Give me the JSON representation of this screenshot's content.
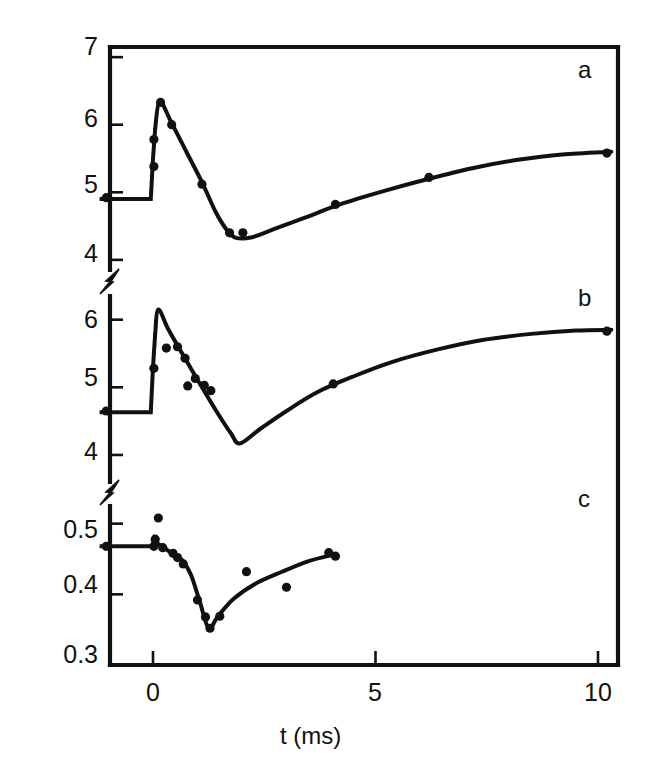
{
  "figure": {
    "background": "#ffffff",
    "ink_color": "#111111",
    "axis_label_x": "t (ms)",
    "axis_label_y_prefix": "H",
    "axis_label_y_sub": "2",
    "axis_label_y_suffix": " partial pressure (Pa)"
  },
  "axes": {
    "x": {
      "label": "t (ms)",
      "ticks": [
        "0",
        "5",
        "10"
      ],
      "tick_values": [
        0,
        5,
        10
      ],
      "range": [
        -1.2,
        10.6
      ],
      "px_left": 110,
      "px_right": 618,
      "px_x0": 153,
      "px_per_unit": 44.5
    },
    "panels": [
      {
        "id": "a",
        "label": "a",
        "ticks": [
          "7",
          "6",
          "5",
          "4"
        ],
        "tick_values": [
          7,
          6,
          5,
          4
        ],
        "px_top": 47,
        "px_bottom": 270,
        "y_at_px_top": 7.15,
        "y_at_px_bottom": 3.85
      },
      {
        "id": "b",
        "label": "b",
        "ticks": [
          "6",
          "5",
          "4"
        ],
        "tick_values": [
          6,
          5,
          4
        ],
        "px_top": 296,
        "px_bottom": 482,
        "y_at_px_top": 6.35,
        "y_at_px_bottom": 3.6
      },
      {
        "id": "c",
        "label": "c",
        "ticks": [
          "0.5",
          "0.4",
          "0.3"
        ],
        "tick_values": [
          0.5,
          0.4,
          0.3
        ],
        "px_top": 506,
        "px_bottom": 665,
        "y_at_px_top": 0.525,
        "y_at_px_bottom": 0.3
      }
    ],
    "breaks": [
      {
        "after_panel": "a",
        "px_y": 283
      },
      {
        "after_panel": "b",
        "px_y": 494
      }
    ]
  },
  "chart_data": {
    "type": "line",
    "title": "",
    "xlabel": "t (ms)",
    "ylabel": "H2 partial pressure (Pa)",
    "xlim": [
      -1.2,
      10.6
    ],
    "grid": false,
    "legend": "none",
    "panels": [
      {
        "id": "a",
        "label": "a",
        "ylim": [
          3.85,
          7.15
        ],
        "yticks": [
          4,
          5,
          6,
          7
        ],
        "baseline": 4.9,
        "peak": {
          "t": 0.15,
          "y": 6.35
        },
        "minimum": {
          "t": 1.85,
          "y": 4.33
        },
        "plateau": 5.6,
        "curve": [
          {
            "t": -1.2,
            "y": 4.9
          },
          {
            "t": -0.05,
            "y": 4.9
          },
          {
            "t": 0.0,
            "y": 5.5
          },
          {
            "t": 0.05,
            "y": 5.95
          },
          {
            "t": 0.15,
            "y": 6.35
          },
          {
            "t": 0.4,
            "y": 6.05
          },
          {
            "t": 0.75,
            "y": 5.6
          },
          {
            "t": 1.1,
            "y": 5.15
          },
          {
            "t": 1.4,
            "y": 4.72
          },
          {
            "t": 1.65,
            "y": 4.45
          },
          {
            "t": 1.85,
            "y": 4.33
          },
          {
            "t": 2.2,
            "y": 4.33
          },
          {
            "t": 2.7,
            "y": 4.45
          },
          {
            "t": 3.4,
            "y": 4.62
          },
          {
            "t": 4.2,
            "y": 4.82
          },
          {
            "t": 5.2,
            "y": 5.02
          },
          {
            "t": 6.2,
            "y": 5.2
          },
          {
            "t": 7.2,
            "y": 5.36
          },
          {
            "t": 8.2,
            "y": 5.48
          },
          {
            "t": 9.2,
            "y": 5.56
          },
          {
            "t": 10.3,
            "y": 5.6
          }
        ],
        "points": [
          {
            "t": -1.05,
            "y": 4.92
          },
          {
            "t": 0.02,
            "y": 5.78
          },
          {
            "t": 0.02,
            "y": 5.38
          },
          {
            "t": 0.17,
            "y": 6.33
          },
          {
            "t": 0.42,
            "y": 6.0
          },
          {
            "t": 1.1,
            "y": 5.12
          },
          {
            "t": 1.72,
            "y": 4.4
          },
          {
            "t": 2.02,
            "y": 4.4
          },
          {
            "t": 4.1,
            "y": 4.82
          },
          {
            "t": 6.2,
            "y": 5.22
          },
          {
            "t": 10.2,
            "y": 5.58
          }
        ]
      },
      {
        "id": "b",
        "label": "b",
        "ylim": [
          3.6,
          6.35
        ],
        "yticks": [
          4,
          5,
          6
        ],
        "baseline": 4.63,
        "peak": {
          "t": 0.12,
          "y": 6.15
        },
        "minimum": {
          "t": 1.95,
          "y": 4.17
        },
        "plateau": 5.85,
        "curve": [
          {
            "t": -1.2,
            "y": 4.63
          },
          {
            "t": -0.05,
            "y": 4.63
          },
          {
            "t": 0.0,
            "y": 5.3
          },
          {
            "t": 0.05,
            "y": 5.8
          },
          {
            "t": 0.12,
            "y": 6.15
          },
          {
            "t": 0.35,
            "y": 5.85
          },
          {
            "t": 0.7,
            "y": 5.45
          },
          {
            "t": 1.1,
            "y": 5.0
          },
          {
            "t": 1.45,
            "y": 4.62
          },
          {
            "t": 1.75,
            "y": 4.32
          },
          {
            "t": 1.95,
            "y": 4.17
          },
          {
            "t": 2.4,
            "y": 4.38
          },
          {
            "t": 3.0,
            "y": 4.65
          },
          {
            "t": 3.7,
            "y": 4.93
          },
          {
            "t": 4.5,
            "y": 5.16
          },
          {
            "t": 5.4,
            "y": 5.38
          },
          {
            "t": 6.4,
            "y": 5.56
          },
          {
            "t": 7.4,
            "y": 5.7
          },
          {
            "t": 8.5,
            "y": 5.79
          },
          {
            "t": 9.5,
            "y": 5.84
          },
          {
            "t": 10.3,
            "y": 5.85
          }
        ],
        "points": [
          {
            "t": -1.05,
            "y": 4.65
          },
          {
            "t": 0.02,
            "y": 5.28
          },
          {
            "t": 0.3,
            "y": 5.58
          },
          {
            "t": 0.55,
            "y": 5.6
          },
          {
            "t": 0.72,
            "y": 5.43
          },
          {
            "t": 0.78,
            "y": 5.02
          },
          {
            "t": 0.95,
            "y": 5.13
          },
          {
            "t": 1.15,
            "y": 5.03
          },
          {
            "t": 1.3,
            "y": 4.95
          },
          {
            "t": 4.05,
            "y": 5.05
          },
          {
            "t": 10.2,
            "y": 5.83
          }
        ]
      },
      {
        "id": "c",
        "label": "c",
        "ylim": [
          0.3,
          0.525
        ],
        "yticks": [
          0.3,
          0.4,
          0.5
        ],
        "baseline": 0.468,
        "peak": {
          "t": 0.05,
          "y": 0.479
        },
        "minimum": {
          "t": 1.25,
          "y": 0.352
        },
        "plateau": 0.457,
        "curve": [
          {
            "t": -1.2,
            "y": 0.468
          },
          {
            "t": -0.02,
            "y": 0.468
          },
          {
            "t": 0.03,
            "y": 0.479
          },
          {
            "t": 0.1,
            "y": 0.472
          },
          {
            "t": 0.25,
            "y": 0.466
          },
          {
            "t": 0.45,
            "y": 0.457
          },
          {
            "t": 0.65,
            "y": 0.449
          },
          {
            "t": 0.85,
            "y": 0.428
          },
          {
            "t": 1.05,
            "y": 0.39
          },
          {
            "t": 1.25,
            "y": 0.352
          },
          {
            "t": 1.45,
            "y": 0.368
          },
          {
            "t": 1.8,
            "y": 0.393
          },
          {
            "t": 2.3,
            "y": 0.415
          },
          {
            "t": 2.9,
            "y": 0.432
          },
          {
            "t": 3.5,
            "y": 0.447
          },
          {
            "t": 4.05,
            "y": 0.456
          }
        ],
        "points": [
          {
            "t": -1.05,
            "y": 0.468
          },
          {
            "t": 0.02,
            "y": 0.468
          },
          {
            "t": 0.05,
            "y": 0.478
          },
          {
            "t": 0.12,
            "y": 0.508
          },
          {
            "t": 0.22,
            "y": 0.466
          },
          {
            "t": 0.45,
            "y": 0.458
          },
          {
            "t": 0.55,
            "y": 0.452
          },
          {
            "t": 0.68,
            "y": 0.443
          },
          {
            "t": 1.0,
            "y": 0.392
          },
          {
            "t": 1.18,
            "y": 0.368
          },
          {
            "t": 1.28,
            "y": 0.352
          },
          {
            "t": 1.5,
            "y": 0.369
          },
          {
            "t": 2.1,
            "y": 0.432
          },
          {
            "t": 3.0,
            "y": 0.41
          },
          {
            "t": 3.95,
            "y": 0.459
          },
          {
            "t": 4.1,
            "y": 0.454
          }
        ]
      }
    ]
  },
  "labels": {
    "panel_a": "a",
    "panel_b": "b",
    "panel_c": "c",
    "ytick_a_7": "7",
    "ytick_a_6": "6",
    "ytick_a_5": "5",
    "ytick_a_4": "4",
    "ytick_b_6": "6",
    "ytick_b_5": "5",
    "ytick_b_4": "4",
    "ytick_c_05": "0.5",
    "ytick_c_04": "0.4",
    "ytick_c_03": "0.3",
    "xtick_0": "0",
    "xtick_5": "5",
    "xtick_10": "10"
  }
}
